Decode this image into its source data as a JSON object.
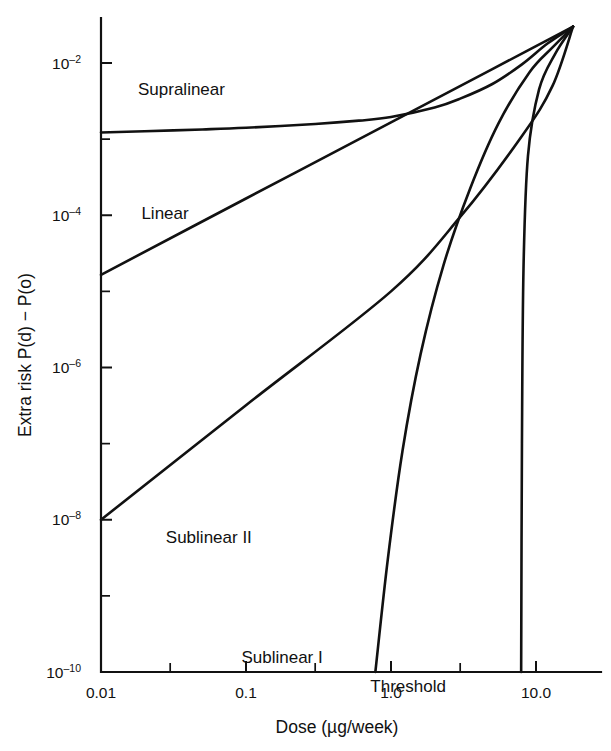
{
  "chart_data": {
    "type": "line",
    "title": "",
    "xlabel": "Dose (µg/week)",
    "ylabel": "Extra risk P(d) − P(o)",
    "xscale": "log",
    "yscale": "log",
    "xlim": [
      0.01,
      20
    ],
    "ylim": [
      1e-10,
      0.035
    ],
    "grid": false,
    "legend_position": "inline-annotations",
    "x_tick_labels": [
      "0.01",
      "0.1",
      "1.0",
      "10.0"
    ],
    "x_tick_values": [
      0.01,
      0.1,
      1.0,
      10.0
    ],
    "y_tick_labels": [
      "10⁻²",
      "10⁻⁴",
      "10⁻⁶",
      "10⁻⁸",
      "10⁻¹⁰"
    ],
    "y_tick_mantissas": [
      "10",
      "10",
      "10",
      "10",
      "10"
    ],
    "y_tick_exponents": [
      "-2",
      "-4",
      "-6",
      "-8",
      "-10"
    ],
    "y_tick_values": [
      0.01,
      0.0001,
      1e-06,
      1e-08,
      1e-10
    ],
    "convergence_point": {
      "x": 18.0,
      "y": 0.03
    },
    "series": [
      {
        "name": "Supralinear",
        "label": "Supralinear",
        "label_x": 0.018,
        "label_y": 0.0038,
        "points": [
          [
            0.01,
            0.00122
          ],
          [
            0.02,
            0.00127
          ],
          [
            0.05,
            0.00134
          ],
          [
            0.1,
            0.00141
          ],
          [
            0.3,
            0.00158
          ],
          [
            0.6,
            0.00175
          ],
          [
            1.0,
            0.00195
          ],
          [
            2.0,
            0.0026
          ],
          [
            3.0,
            0.0034
          ],
          [
            5.0,
            0.0053
          ],
          [
            8.0,
            0.0096
          ],
          [
            12.0,
            0.018
          ],
          [
            18.0,
            0.03
          ]
        ]
      },
      {
        "name": "Linear",
        "label": "Linear",
        "label_x": 0.019,
        "label_y": 9e-05,
        "points": [
          [
            0.01,
            1.65e-05
          ],
          [
            0.1,
            0.000166
          ],
          [
            1.0,
            0.00166
          ],
          [
            5.0,
            0.0083
          ],
          [
            10.0,
            0.0167
          ],
          [
            18.0,
            0.03
          ]
        ]
      },
      {
        "name": "Sublinear II",
        "label": "Sublinear II",
        "label_x": 0.028,
        "label_y": 5e-09,
        "points": [
          [
            0.01,
            1e-08
          ],
          [
            0.1,
            3.2e-07
          ],
          [
            1.0,
            1e-05
          ],
          [
            3.0,
            9.5e-05
          ],
          [
            8.0,
            0.0011
          ],
          [
            13.0,
            0.005
          ],
          [
            18.0,
            0.03
          ]
        ]
      },
      {
        "name": "Sublinear I",
        "label": "Sublinear I",
        "label_x": 0.093,
        "label_y": 1.3e-10,
        "points": [
          [
            0.78,
            1e-10
          ],
          [
            0.95,
            3e-09
          ],
          [
            1.2,
            8e-08
          ],
          [
            1.6,
            1.5e-06
          ],
          [
            2.3,
            2.2e-05
          ],
          [
            3.5,
            0.00022
          ],
          [
            5.5,
            0.0016
          ],
          [
            9.0,
            0.0075
          ],
          [
            13.0,
            0.016
          ],
          [
            18.0,
            0.03
          ]
        ]
      },
      {
        "name": "Threshold",
        "label": "Threshold",
        "label_x": 0.72,
        "label_y": 5.5e-11,
        "points": [
          [
            7.9,
            1e-10
          ],
          [
            8.0,
            1e-07
          ],
          [
            8.2,
            2e-05
          ],
          [
            8.8,
            0.0006
          ],
          [
            10.5,
            0.0045
          ],
          [
            13.5,
            0.013
          ],
          [
            18.0,
            0.03
          ]
        ]
      }
    ]
  }
}
